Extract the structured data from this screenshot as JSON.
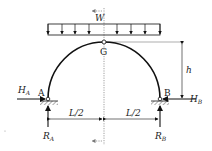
{
  "diagram": {
    "colors": {
      "stroke": "#111111",
      "guide": "#888888",
      "background": "#ffffff"
    },
    "load": {
      "label": "W",
      "arrow_count": 9
    },
    "nodes": {
      "crown": {
        "label": "G"
      },
      "left_support": {
        "label": "A"
      },
      "right_support": {
        "label": "B"
      }
    },
    "forces": {
      "h_a": {
        "main": "H",
        "sub": "A"
      },
      "h_b": {
        "main": "H",
        "sub": "B"
      },
      "r_a": {
        "main": "R",
        "sub": "A"
      },
      "r_b": {
        "main": "R",
        "sub": "B"
      }
    },
    "dimensions": {
      "height": "h",
      "half_span_left": "L/2",
      "half_span_right": "L/2"
    }
  }
}
